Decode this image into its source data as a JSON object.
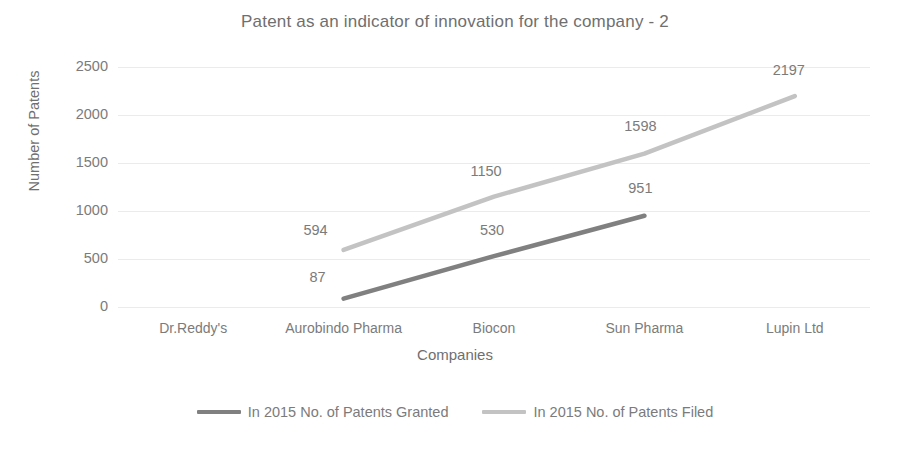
{
  "chart_data": {
    "type": "line",
    "title": "Patent as an indicator of innovation for the company - 2",
    "xlabel": "Companies",
    "ylabel": "Number of Patents",
    "categories": [
      "Dr.Reddy's",
      "Aurobindo Pharma",
      "Biocon",
      "Sun Pharma",
      "Lupin Ltd"
    ],
    "ylim": [
      0,
      2500
    ],
    "yticks": [
      0,
      500,
      1000,
      1500,
      2000,
      2500
    ],
    "ytick_labels": [
      "0",
      "500",
      "1000",
      "1500",
      "2000",
      "2500"
    ],
    "grid": true,
    "legend_position": "bottom",
    "series": [
      {
        "name": "In 2015 No. of Patents Granted",
        "color": "#808080",
        "values": [
          null,
          87,
          530,
          951,
          null
        ],
        "labels": [
          "",
          "87",
          "530",
          "951",
          ""
        ]
      },
      {
        "name": "In 2015 No. of Patents Filed",
        "color": "#c3c3c3",
        "values": [
          null,
          594,
          1150,
          1598,
          2197
        ],
        "labels": [
          "",
          "594",
          "1150",
          "1598",
          "2197"
        ]
      }
    ]
  },
  "legend": {
    "items": [
      {
        "label": "In 2015 No. of Patents Granted",
        "color": "#808080"
      },
      {
        "label": "In 2015 No. of Patents Filed",
        "color": "#c3c3c3"
      }
    ]
  }
}
